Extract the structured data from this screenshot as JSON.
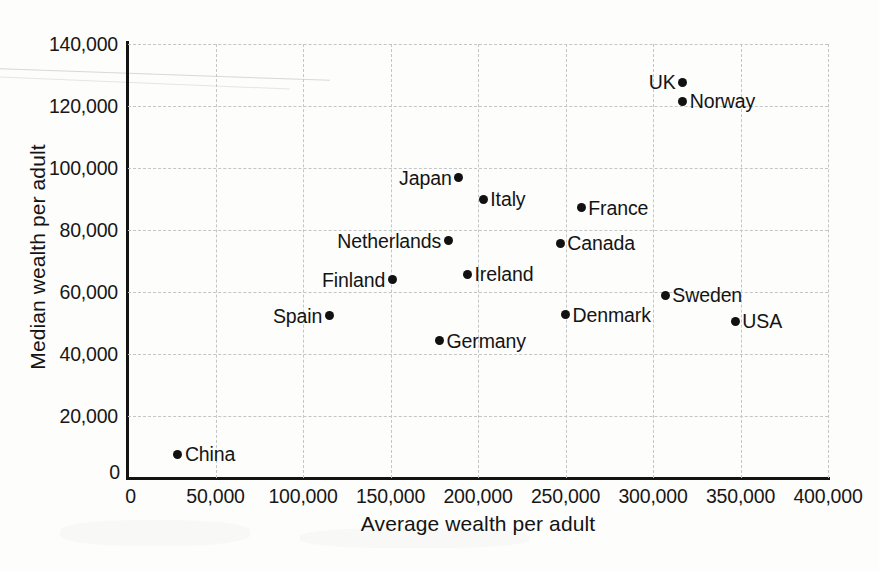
{
  "chart_data": {
    "type": "scatter",
    "title": "",
    "xlabel": "Average wealth per adult",
    "ylabel": "Median wealth per adult",
    "xlim": [
      0,
      400000
    ],
    "ylim": [
      0,
      140000
    ],
    "xticks": [
      "0",
      "50,000",
      "100,000",
      "150,000",
      "200,000",
      "250,000",
      "300,000",
      "350,000",
      "400,000"
    ],
    "xtick_values": [
      0,
      50000,
      100000,
      150000,
      200000,
      250000,
      300000,
      350000,
      400000
    ],
    "yticks": [
      "0",
      "20,000",
      "40,000",
      "60,000",
      "80,000",
      "100,000",
      "120,000",
      "140,000"
    ],
    "ytick_values": [
      0,
      20000,
      40000,
      60000,
      80000,
      100000,
      120000,
      140000
    ],
    "grid": true,
    "grid_style": "dashed",
    "legend": "none",
    "marker": "filled-circle",
    "marker_color": "#111111",
    "points": [
      {
        "label": "China",
        "x": 28500,
        "y": 7700,
        "label_side": "right"
      },
      {
        "label": "Spain",
        "x": 115000,
        "y": 52300,
        "label_side": "left"
      },
      {
        "label": "Germany",
        "x": 178000,
        "y": 44200,
        "label_side": "right"
      },
      {
        "label": "Finland",
        "x": 151000,
        "y": 63900,
        "label_side": "left"
      },
      {
        "label": "Netherlands",
        "x": 183000,
        "y": 76500,
        "label_side": "left"
      },
      {
        "label": "Japan",
        "x": 189000,
        "y": 96800,
        "label_side": "left"
      },
      {
        "label": "Ireland",
        "x": 194000,
        "y": 65800,
        "label_side": "right"
      },
      {
        "label": "Italy",
        "x": 203000,
        "y": 90000,
        "label_side": "right"
      },
      {
        "label": "Canada",
        "x": 247000,
        "y": 75800,
        "label_side": "right"
      },
      {
        "label": "Denmark",
        "x": 250000,
        "y": 52600,
        "label_side": "right"
      },
      {
        "label": "France",
        "x": 259000,
        "y": 87100,
        "label_side": "right"
      },
      {
        "label": "Sweden",
        "x": 307000,
        "y": 59000,
        "label_side": "right"
      },
      {
        "label": "UK",
        "x": 317000,
        "y": 127700,
        "label_side": "left"
      },
      {
        "label": "Norway",
        "x": 317000,
        "y": 121600,
        "label_side": "right"
      },
      {
        "label": "USA",
        "x": 347000,
        "y": 50600,
        "label_side": "right"
      }
    ]
  }
}
